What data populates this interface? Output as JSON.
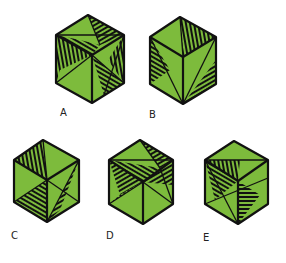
{
  "colors": {
    "green": "#7dbb3c",
    "stroke": "#111111",
    "background": "#ffffff"
  },
  "figures": [
    {
      "id": "A",
      "label": "A",
      "cx": 90,
      "cy": 59,
      "w": 70,
      "h": 88,
      "label_pos": [
        60,
        107
      ],
      "faces": {
        "top": [
          [
            "green",
            "hatch-h",
            "green"
          ],
          "diag-split-A"
        ],
        "left": [
          "hatch",
          "green"
        ],
        "right": [
          "green",
          "hatch"
        ]
      }
    },
    {
      "id": "B",
      "label": "B",
      "cx": 183,
      "cy": 60,
      "w": 66,
      "h": 88,
      "label_pos": [
        149,
        109
      ]
    },
    {
      "id": "C",
      "label": "C",
      "cx": 46,
      "cy": 181,
      "w": 66,
      "h": 84,
      "label_pos": [
        11,
        230
      ]
    },
    {
      "id": "D",
      "label": "D",
      "cx": 141,
      "cy": 182,
      "w": 66,
      "h": 86,
      "label_pos": [
        106,
        230
      ]
    },
    {
      "id": "E",
      "label": "E",
      "cx": 236,
      "cy": 183,
      "w": 64,
      "h": 84,
      "label_pos": [
        203,
        232
      ]
    }
  ]
}
